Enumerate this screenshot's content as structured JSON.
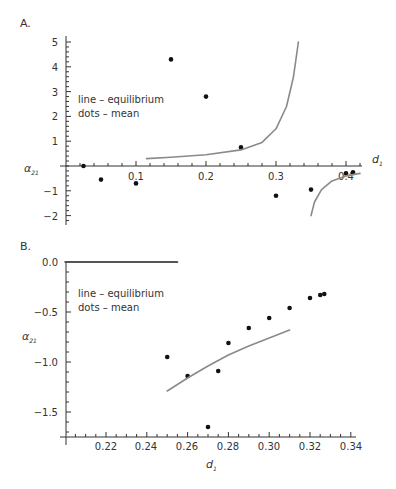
{
  "chart_data": [
    {
      "panel": "A.",
      "type": "scatter",
      "legend": [
        "line – equilibrium",
        "dots – mean"
      ],
      "xlabel": "d1",
      "ylabel": "α21",
      "xlim": [
        0,
        0.43
      ],
      "ylim": [
        -2.3,
        5.2
      ],
      "x_ticks": [
        0.1,
        0.2,
        0.3,
        0.4
      ],
      "y_ticks": [
        -2,
        -1,
        1,
        2,
        3,
        4,
        5
      ],
      "grid": false,
      "series": [
        {
          "name": "mean",
          "kind": "dots",
          "points": [
            [
              0.025,
              0.0
            ],
            [
              0.05,
              -0.55
            ],
            [
              0.1,
              -0.7
            ],
            [
              0.15,
              4.3
            ],
            [
              0.2,
              2.8
            ],
            [
              0.25,
              0.75
            ],
            [
              0.3,
              -1.2
            ],
            [
              0.35,
              -0.95
            ],
            [
              0.4,
              -0.3
            ],
            [
              0.41,
              -0.25
            ]
          ]
        },
        {
          "name": "equilibrium",
          "kind": "line",
          "branches": [
            [
              [
                0.115,
                0.3
              ],
              [
                0.15,
                0.35
              ],
              [
                0.2,
                0.45
              ],
              [
                0.25,
                0.65
              ],
              [
                0.28,
                0.95
              ],
              [
                0.3,
                1.5
              ],
              [
                0.315,
                2.4
              ],
              [
                0.325,
                3.6
              ],
              [
                0.332,
                5.0
              ]
            ],
            [
              [
                0.35,
                -2.0
              ],
              [
                0.355,
                -1.45
              ],
              [
                0.365,
                -0.95
              ],
              [
                0.38,
                -0.6
              ],
              [
                0.4,
                -0.4
              ],
              [
                0.42,
                -0.3
              ]
            ]
          ]
        }
      ]
    },
    {
      "panel": "B.",
      "type": "scatter",
      "legend": [
        "line – equilibrium",
        "dots – mean"
      ],
      "xlabel": "d1",
      "ylabel": "α21",
      "xlim": [
        0.2,
        0.345
      ],
      "ylim": [
        -1.75,
        0.05
      ],
      "x_ticks": [
        0.22,
        0.24,
        0.26,
        0.28,
        0.3,
        0.32,
        0.34
      ],
      "y_ticks": [
        0.0,
        -0.5,
        -1.0,
        -1.5
      ],
      "grid": false,
      "series": [
        {
          "name": "mean",
          "kind": "dots",
          "points": [
            [
              0.25,
              -0.95
            ],
            [
              0.26,
              -1.14
            ],
            [
              0.27,
              -1.65
            ],
            [
              0.275,
              -1.09
            ],
            [
              0.28,
              -0.81
            ],
            [
              0.29,
              -0.66
            ],
            [
              0.3,
              -0.56
            ],
            [
              0.31,
              -0.46
            ],
            [
              0.32,
              -0.36
            ],
            [
              0.325,
              -0.33
            ],
            [
              0.327,
              -0.32
            ]
          ]
        },
        {
          "name": "equilibrium",
          "kind": "line",
          "branches": [
            [
              [
                0.25,
                -1.29
              ],
              [
                0.26,
                -1.16
              ],
              [
                0.27,
                -1.04
              ],
              [
                0.28,
                -0.93
              ],
              [
                0.29,
                -0.84
              ],
              [
                0.3,
                -0.76
              ],
              [
                0.31,
                -0.68
              ]
            ]
          ]
        },
        {
          "name": "zero-line",
          "kind": "line",
          "branches": [
            [
              [
                0.2,
                0.0
              ],
              [
                0.255,
                0.0
              ]
            ]
          ]
        }
      ]
    }
  ],
  "panels": {
    "a": {
      "label": "A.",
      "legend_line": "line – equilibrium",
      "legend_dots": "dots – mean",
      "xlabel_main": "d",
      "xlabel_sub": "1",
      "ylabel_main": "α",
      "ylabel_sub": "21",
      "xticks": [
        "0.1",
        "0.2",
        "0.3",
        "0.4"
      ],
      "yticks": [
        "5",
        "4",
        "3",
        "2",
        "1",
        "−1",
        "−2"
      ]
    },
    "b": {
      "label": "B.",
      "legend_line": "line – equilibrium",
      "legend_dots": "dots – mean",
      "xlabel_main": "d",
      "xlabel_sub": "1",
      "ylabel_main": "α",
      "ylabel_sub": "21",
      "xticks": [
        "0.22",
        "0.24",
        "0.26",
        "0.28",
        "0.30",
        "0.32",
        "0.34"
      ],
      "yticks": [
        "0.0",
        "−0.5",
        "−1.0",
        "−1.5"
      ]
    }
  },
  "colors": {
    "line": "#8a8a8a",
    "dots": "#111111",
    "axis": "#333333"
  }
}
